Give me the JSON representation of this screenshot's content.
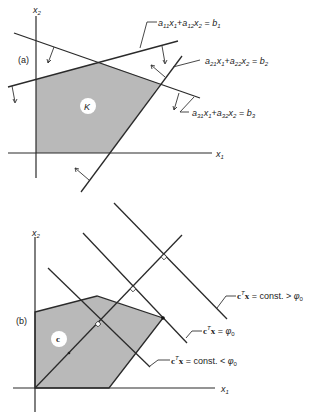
{
  "figure": {
    "panel_a": {
      "tag": "(a)",
      "axis_x": "x",
      "axis_x_sub": "1",
      "axis_y": "x",
      "axis_y_sub": "2",
      "region_label": "K",
      "constraints": [
        {
          "a1": "a",
          "a1_sub": "11",
          "x1": "x",
          "x1_sub": "1",
          "plus": "+",
          "a2": "a",
          "a2_sub": "12",
          "x2": "x",
          "x2_sub": "2",
          "eq": "=",
          "b": "b",
          "b_sub": "1"
        },
        {
          "a1": "a",
          "a1_sub": "21",
          "x1": "x",
          "x1_sub": "1",
          "plus": "+",
          "a2": "a",
          "a2_sub": "22",
          "x2": "x",
          "x2_sub": "2",
          "eq": "=",
          "b": "b",
          "b_sub": "2"
        },
        {
          "a1": "a",
          "a1_sub": "31",
          "x1": "x",
          "x1_sub": "1",
          "plus": "+",
          "a2": "a",
          "a2_sub": "32",
          "x2": "x",
          "x2_sub": "2",
          "eq": "=",
          "b": "b",
          "b_sub": "3"
        }
      ]
    },
    "panel_b": {
      "tag": "(b)",
      "axis_x": "x",
      "axis_x_sub": "1",
      "axis_y": "x",
      "axis_y_sub": "2",
      "vector_label": "c",
      "level_lines": [
        {
          "c": "c",
          "sup": "T",
          "x": "x",
          "rest": " = const. > ",
          "phi": "φ",
          "phi_sub": "0"
        },
        {
          "c": "c",
          "sup": "T",
          "x": "x",
          "rest": " = ",
          "phi": "φ",
          "phi_sub": "0"
        },
        {
          "c": "c",
          "sup": "T",
          "x": "x",
          "rest": " = const. < ",
          "phi": "φ",
          "phi_sub": "0"
        }
      ]
    }
  }
}
